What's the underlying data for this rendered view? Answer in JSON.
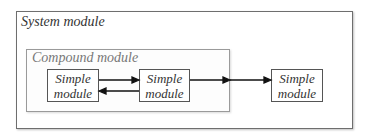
{
  "diagram": {
    "system_module": {
      "label": "System module"
    },
    "compound_module": {
      "label": "Compound module"
    },
    "simple_modules": [
      {
        "line1": "Simple",
        "line2": "module"
      },
      {
        "line1": "Simple",
        "line2": "module"
      },
      {
        "line1": "Simple",
        "line2": "module"
      }
    ],
    "connections": [
      {
        "from": "simple_1",
        "to": "simple_2",
        "direction": "right"
      },
      {
        "from": "simple_2",
        "to": "simple_1",
        "direction": "left"
      },
      {
        "from": "simple_2",
        "to": "compound_border",
        "direction": "right"
      },
      {
        "from": "compound_border",
        "to": "simple_3",
        "direction": "right"
      }
    ]
  }
}
